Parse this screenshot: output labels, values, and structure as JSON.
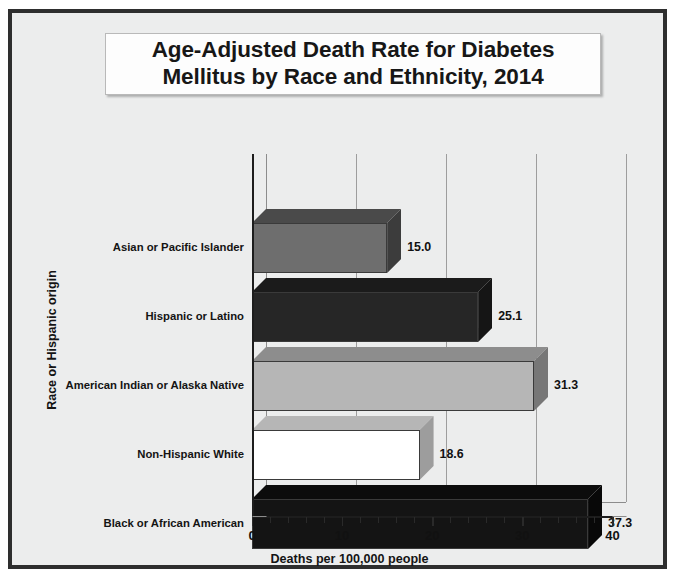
{
  "figure": {
    "title": "Age-Adjusted Death Rate for Diabetes\nMellitus by Race and Ethnicity, 2014",
    "background_color": "#eceded",
    "border_color": "#2e2e2e"
  },
  "axes": {
    "x_title": "Deaths per 100,000 people",
    "y_title": "Race or Hispanic origin",
    "x_ticks": [
      "0",
      "10",
      "20",
      "30",
      "40"
    ],
    "x_min": 0,
    "x_max": 40,
    "x_minor_step": 2
  },
  "chart_data": {
    "type": "bar",
    "orientation": "horizontal",
    "title": "Age-Adjusted Death Rate for Diabetes Mellitus by Race and Ethnicity, 2014",
    "xlabel": "Deaths per 100,000 people",
    "ylabel": "Race or Hispanic origin",
    "xlim": [
      0,
      40
    ],
    "grid": true,
    "legend": "none",
    "style": "3d",
    "categories": [
      "Asian or Pacific Islander",
      "Hispanic or Latino",
      "American Indian or Alaska Native",
      "Non-Hispanic White",
      "Black or African American"
    ],
    "values": [
      15.0,
      25.1,
      31.3,
      18.6,
      37.3
    ],
    "value_labels": [
      "15.0",
      "25.1",
      "31.3",
      "18.6",
      "37.3"
    ],
    "bar_colors": [
      "#6e6e6e",
      "#262626",
      "#b6b6b6",
      "#ffffff",
      "#141414"
    ],
    "bar_top_colors": [
      "#4a4a4a",
      "#1b1b1b",
      "#8d8d8d",
      "#b6b6b6",
      "#0c0c0c"
    ],
    "bar_side_colors": [
      "#3c3c3c",
      "#151515",
      "#777777",
      "#9d9d9d",
      "#080808"
    ]
  }
}
